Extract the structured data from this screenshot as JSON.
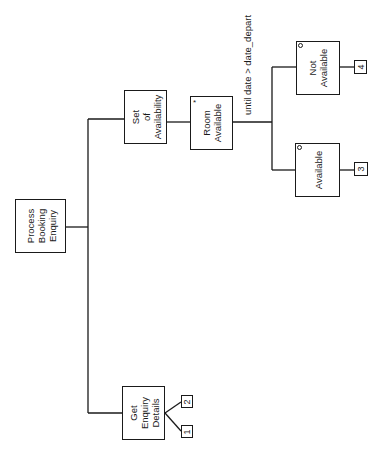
{
  "diagram": {
    "type": "Jackson Structured Programming (JSP) structure diagram",
    "orientation": "rotated 90 degrees counter-clockwise",
    "root": {
      "label_lines": [
        "Process",
        "Booking",
        "Enquiry"
      ]
    },
    "nodes": {
      "get_enquiry": {
        "label_lines": [
          "Get",
          "Enquiry",
          "Details"
        ],
        "operations": [
          "1",
          "2"
        ]
      },
      "set_availability": {
        "label_lines": [
          "Set",
          "of",
          "Availability"
        ]
      },
      "room_available": {
        "label_lines": [
          "Room",
          "Available"
        ],
        "marker": "*"
      },
      "condition": "until date > date_depart",
      "available": {
        "label_lines": [
          "Available"
        ],
        "marker": "o",
        "operations": [
          "3"
        ]
      },
      "not_available": {
        "label_lines": [
          "Not",
          "Available"
        ],
        "marker": "o",
        "operations": [
          "4"
        ]
      }
    }
  }
}
